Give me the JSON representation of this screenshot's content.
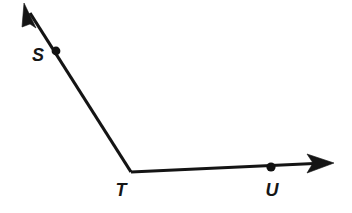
{
  "figure": {
    "background_color": "#ffffff",
    "stroke_color": "#141414",
    "label_color": "#161616",
    "width": 352,
    "height": 213
  },
  "points": [
    {
      "id": "S",
      "label": "S",
      "dot_x": 56,
      "dot_y": 51,
      "dot_radius": 4.4,
      "label_x": 38,
      "label_y": 61
    },
    {
      "id": "T",
      "label": "T",
      "dot_x": 131,
      "dot_y": 172,
      "dot_radius": 0,
      "label_x": 121,
      "label_y": 196,
      "is_vertex": true
    },
    {
      "id": "U",
      "label": "U",
      "dot_x": 271,
      "dot_y": 167,
      "dot_radius": 4.6,
      "label_x": 272,
      "label_y": 196
    }
  ],
  "rays": [
    {
      "id": "ray-TS",
      "name": "ray-t-to-s",
      "from_x": 131,
      "from_y": 172,
      "to_x": 27,
      "to_y": 8,
      "arrow_tip_x": 24,
      "arrow_tip_y": 3,
      "arrow_angle_deg": 237.6,
      "has_arrow": true
    },
    {
      "id": "ray-TU",
      "name": "ray-t-to-u",
      "from_x": 131,
      "from_y": 172,
      "to_x": 327,
      "to_y": 163,
      "arrow_tip_x": 334,
      "arrow_tip_y": 163,
      "arrow_angle_deg": 0,
      "has_arrow": true
    }
  ],
  "arrow_geometry": {
    "length": 20,
    "half_width": 6.5,
    "notch": 5.5
  }
}
